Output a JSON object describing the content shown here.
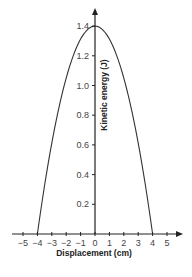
{
  "chart_data": {
    "type": "line",
    "title": "",
    "xlabel": "Displacement (cm)",
    "ylabel": "Kinetic energy (J)",
    "xlim": [
      -5,
      5
    ],
    "ylim": [
      0,
      1.4
    ],
    "x_ticks": [
      "−5",
      "−4",
      "−3",
      "−2",
      "−1",
      "0",
      "1",
      "2",
      "3",
      "4",
      "5"
    ],
    "y_ticks": [
      "0.2",
      "0.4",
      "0.6",
      "0.8",
      "1.0",
      "1.2",
      "1.4"
    ],
    "grid": false,
    "legend": null,
    "series": [
      {
        "name": "Kinetic energy",
        "shape": "inverted parabola",
        "x": [
          -4,
          -3,
          -2,
          -1,
          0,
          1,
          2,
          3,
          4
        ],
        "values": [
          0,
          0.6125,
          1.05,
          1.3125,
          1.4,
          1.3125,
          1.05,
          0.6125,
          0
        ]
      }
    ]
  }
}
